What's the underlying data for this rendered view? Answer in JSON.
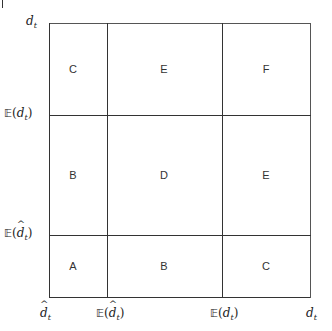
{
  "figure": {
    "corner_mark": "|",
    "y_axis": {
      "labels": [
        {
          "bb": "",
          "sym": "d",
          "sub": "t",
          "hat": false
        },
        {
          "bb": "𝔼",
          "sym": "d",
          "sub": "t",
          "hat": false
        },
        {
          "bb": "𝔼",
          "sym": "d",
          "sub": "t",
          "hat": true
        }
      ]
    },
    "x_axis": {
      "labels": [
        {
          "bb": "",
          "sym": "d",
          "sub": "t",
          "hat": true
        },
        {
          "bb": "𝔼",
          "sym": "d",
          "sub": "t",
          "hat": true
        },
        {
          "bb": "𝔼",
          "sym": "d",
          "sub": "t",
          "hat": false
        },
        {
          "bb": "",
          "sym": "d",
          "sub": "t",
          "hat": false
        }
      ]
    },
    "cells": {
      "top": [
        "C",
        "E",
        "F"
      ],
      "middle": [
        "B",
        "D",
        "E"
      ],
      "bottom": [
        "A",
        "B",
        "C"
      ]
    }
  }
}
